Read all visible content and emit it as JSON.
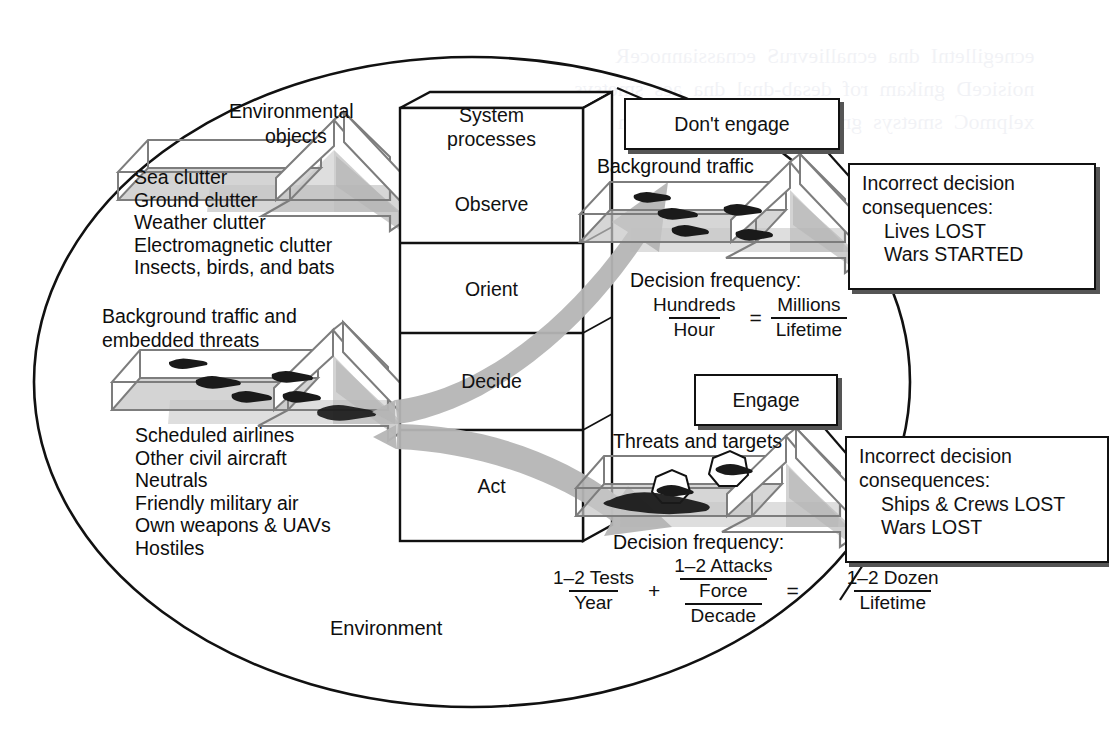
{
  "diagram": {
    "title_label": "Environment",
    "ellipse_label": "Environment",
    "left_inputs": {
      "environmental_objects": {
        "label": "Environmental\nobjects",
        "label_line1": "Environmental",
        "label_line2": "objects",
        "items": [
          "Sea clutter",
          "Ground clutter",
          "Weather clutter",
          "Electromagnetic clutter",
          "Insects, birds, and bats"
        ]
      },
      "background_traffic": {
        "label_line1": "Background traffic and",
        "label_line2": "embedded threats",
        "items": [
          "Scheduled airlines",
          "Other civil aircraft",
          "Neutrals",
          "Friendly military air",
          "Own weapons & UAVs",
          "Hostiles"
        ]
      }
    },
    "system_box": {
      "title_line1": "System",
      "title_line2": "processes",
      "stages": [
        "Observe",
        "Orient",
        "Decide",
        "Act"
      ]
    },
    "outputs": {
      "upper": {
        "tray_label": "Background traffic",
        "decision_button": "Don't engage",
        "frequency_label": "Decision frequency:",
        "frequency": {
          "left_numerator": "Hundreds",
          "left_denominator": "Hour",
          "equals": "=",
          "right_numerator": "Millions",
          "right_denominator": "Lifetime"
        },
        "consequences": {
          "line1": "Incorrect decision",
          "line2": "consequences:",
          "line3": "Lives LOST",
          "line4": "Wars STARTED"
        }
      },
      "lower": {
        "tray_label": "Threats and targets",
        "decision_button": "Engage",
        "frequency_label": "Decision frequency:",
        "frequency": {
          "term1_numerator": "1–2 Tests",
          "term1_denominator": "Year",
          "plus": "+",
          "term2_numerator": "1–2 Attacks",
          "term2_denominator_numerator": "Force",
          "term2_denominator_denominator": "Decade",
          "equals": "=",
          "result_numerator": "1–2 Dozen",
          "result_denominator": "Lifetime"
        },
        "consequences": {
          "line1": "Incorrect decision",
          "line2": "consequences:",
          "line3": "Ships & Crews LOST",
          "line4": "Wars LOST"
        }
      }
    },
    "colors": {
      "line": "#111111",
      "gray_fill": "#b3b3b3",
      "gray_edge": "#8a8a8a",
      "shadow": "#555555",
      "paper": "#ffffff"
    }
  }
}
